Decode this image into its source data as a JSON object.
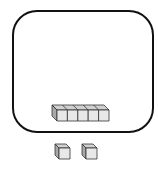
{
  "diagram": {
    "container": {
      "shape": "rounded-rectangle",
      "stroke": "#111111",
      "fill": "#ffffff"
    },
    "rod": {
      "cube_count": 5,
      "face_color": "#e8e8e8",
      "top_color": "#d0d0d0",
      "side_color": "#a8a8a8",
      "stroke": "#333333"
    },
    "loose_cubes": {
      "count": 2,
      "face_color": "#e8e8e8",
      "top_color": "#d0d0d0",
      "side_color": "#a8a8a8",
      "stroke": "#333333"
    }
  }
}
